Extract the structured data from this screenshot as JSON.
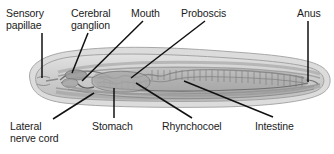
{
  "figure": {
    "background_color": "#ffffff",
    "text_color": "#1b1b1b",
    "leader_line_color": "#111111",
    "body_outline_color": "#8f8f8f",
    "body_fill_color": "#d4d4d4",
    "gut_fill_color": "#9e9e9e"
  },
  "labels": {
    "sensory_papillae": "Sensory\npapillae",
    "cerebral_ganglion": "Cerebral\nganglion",
    "mouth": "Mouth",
    "proboscis": "Proboscis",
    "anus": "Anus",
    "lateral_nerve_cord": "Lateral\nnerve cord",
    "stomach": "Stomach",
    "rhynchocoel": "Rhynchocoel",
    "intestine": "Intestine"
  },
  "callouts": [
    {
      "id": "sensory-papillae",
      "label": "Sensory\npapillae",
      "position": "top",
      "text_x": 6,
      "text_y": 8,
      "text_align": "left",
      "leader": {
        "x1": 42,
        "y1": 33,
        "x2": 42,
        "y2": 78
      }
    },
    {
      "id": "cerebral-ganglion",
      "label": "Cerebral\nganglion",
      "position": "top",
      "text_x": 71,
      "text_y": 8,
      "text_align": "left",
      "leader": {
        "x1": 88,
        "y1": 33,
        "x2": 72,
        "y2": 73
      }
    },
    {
      "id": "mouth",
      "label": "Mouth",
      "position": "top",
      "text_x": 131,
      "text_y": 8,
      "text_align": "left",
      "leader": {
        "x1": 143,
        "y1": 21,
        "x2": 82,
        "y2": 81
      }
    },
    {
      "id": "proboscis",
      "label": "Proboscis",
      "position": "top",
      "text_x": 181,
      "text_y": 8,
      "text_align": "left",
      "leader": {
        "x1": 205,
        "y1": 21,
        "x2": 131,
        "y2": 78
      }
    },
    {
      "id": "anus",
      "label": "Anus",
      "position": "top",
      "text_x": 297,
      "text_y": 8,
      "text_align": "left",
      "leader": {
        "x1": 308,
        "y1": 21,
        "x2": 308,
        "y2": 82
      }
    },
    {
      "id": "lateral-nerve-cord",
      "label": "Lateral\nnerve cord",
      "position": "bottom",
      "text_x": 10,
      "text_y": 121,
      "text_align": "left",
      "leader": {
        "x1": 53,
        "y1": 119,
        "x2": 94,
        "y2": 93
      }
    },
    {
      "id": "stomach",
      "label": "Stomach",
      "position": "bottom",
      "text_x": 92,
      "text_y": 121,
      "text_align": "left",
      "leader": {
        "x1": 114,
        "y1": 118,
        "x2": 114,
        "y2": 88
      }
    },
    {
      "id": "rhynchocoel",
      "label": "Rhynchocoel",
      "position": "bottom",
      "text_x": 162,
      "text_y": 121,
      "text_align": "left",
      "leader": {
        "x1": 192,
        "y1": 118,
        "x2": 136,
        "y2": 83
      }
    },
    {
      "id": "intestine",
      "label": "Intestine",
      "position": "bottom",
      "text_x": 255,
      "text_y": 121,
      "text_align": "left",
      "leader": {
        "x1": 273,
        "y1": 117,
        "x2": 184,
        "y2": 81
      }
    }
  ]
}
